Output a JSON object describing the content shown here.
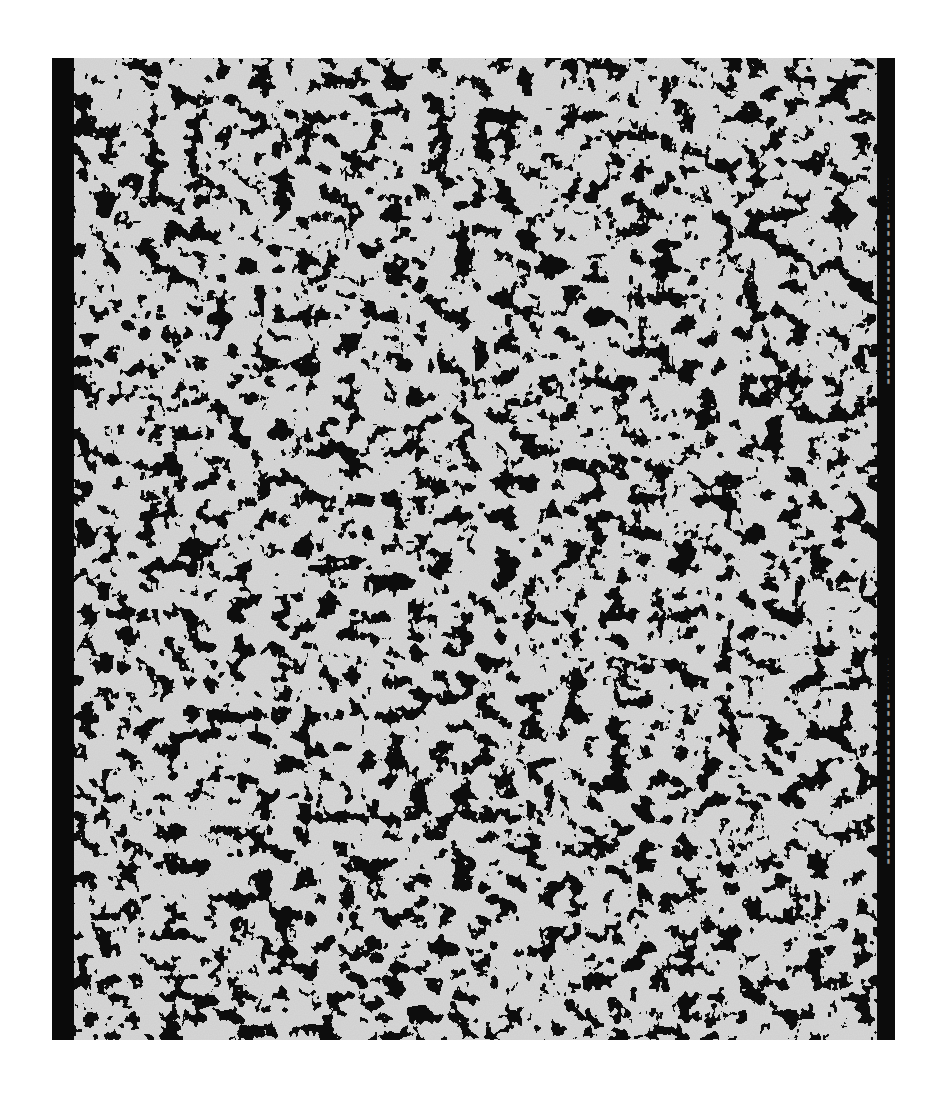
{
  "artwork": {
    "subject": "abstract textile print",
    "palette": {
      "background": "#ffffff",
      "ground": "#cfcfcf",
      "ink": "#111111",
      "selvage": "#0a0a0a"
    },
    "selvage_text_1": "· · · · · ·  ▮▮▮ ▮▮ ▮▮▮▮ ▮▮▮▮▮ ▮▮▮▮▮▮",
    "selvage_text_2": "· · · · · ·  ▮▮▮ ▮▮ ▮▮▮▮ ▮▮▮▮▮ ▮▮▮▮▮▮"
  }
}
